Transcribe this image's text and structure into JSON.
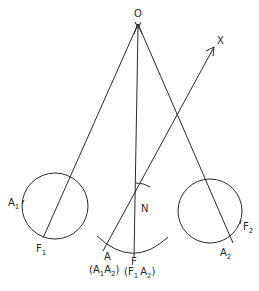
{
  "diagram": {
    "colors": {
      "ink": "#2a2a2a",
      "background": "#ffffff"
    },
    "labels": {
      "O": "O",
      "X": "X",
      "N": "N",
      "A1": {
        "main": "A",
        "sub": "1"
      },
      "F1": {
        "main": "F",
        "sub": "1"
      },
      "A2": {
        "main": "A",
        "sub": "2"
      },
      "F2": {
        "main": "F",
        "sub": "2"
      },
      "A": "A",
      "F": "F",
      "A_paren": {
        "open": "(",
        "m1": "A",
        "s1": "1",
        "m2": "A",
        "s2": "2",
        "close": ")"
      },
      "F_paren": {
        "open": "(",
        "m1": "F",
        "s1": "1",
        "m2": "A",
        "s2": "2",
        "close": ")"
      }
    },
    "points": {
      "O": [
        138,
        24
      ],
      "X_tip": [
        214,
        47
      ],
      "N": [
        135,
        205
      ],
      "A": [
        103,
        251
      ],
      "F": [
        134,
        257
      ],
      "F1": [
        43,
        238
      ],
      "A2": [
        233,
        243
      ]
    },
    "circles": [
      {
        "name": "left-circle",
        "cx": 55,
        "cy": 206,
        "r": 33
      },
      {
        "name": "right-circle",
        "cx": 210,
        "cy": 211,
        "r": 32
      }
    ]
  }
}
